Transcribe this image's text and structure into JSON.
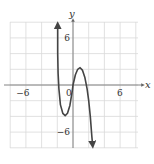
{
  "chart_data": {
    "type": "line",
    "title": "",
    "xlabel": "x",
    "ylabel": "y",
    "xlim": [
      -8,
      8
    ],
    "ylim": [
      -8,
      8
    ],
    "grid": true,
    "grid_step": 2,
    "tick_labels": {
      "x": [
        {
          "value": -6,
          "label": "−6"
        },
        {
          "value": 0,
          "label": "0"
        },
        {
          "value": 6,
          "label": "6"
        }
      ],
      "y": [
        {
          "value": 6,
          "label": "6"
        },
        {
          "value": -6,
          "label": "−6"
        }
      ]
    },
    "series": [
      {
        "name": "f(x)",
        "arrows": [
          "up-left-end",
          "down-right-end"
        ],
        "x": [
          -1.95,
          -1.95,
          -1.9,
          -1.8,
          -1.6,
          -1.3,
          -1.0,
          -0.7,
          -0.4,
          -0.1,
          0.0,
          0.3,
          0.6,
          0.9,
          1.2,
          1.5,
          1.8,
          2.0,
          2.2,
          2.4,
          2.5
        ],
        "y": [
          7.6,
          4.0,
          1.5,
          -0.5,
          -2.5,
          -3.6,
          -3.9,
          -3.6,
          -2.6,
          -0.8,
          0.0,
          1.3,
          2.0,
          2.2,
          1.9,
          1.0,
          -0.5,
          -2.0,
          -4.0,
          -6.5,
          -7.6
        ]
      }
    ],
    "x_intercepts": [
      -2,
      0,
      2
    ],
    "local_min": {
      "x": -1,
      "y": -3.9
    },
    "local_max": {
      "x": 1,
      "y": 2.2
    }
  }
}
